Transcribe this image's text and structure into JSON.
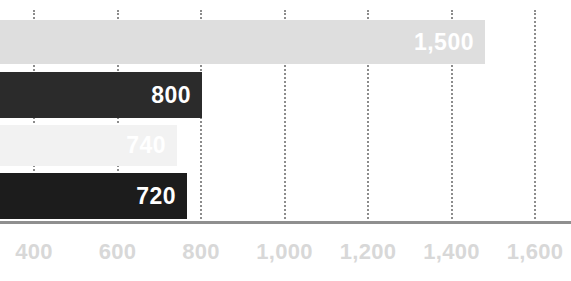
{
  "chart_data": {
    "type": "bar",
    "orientation": "horizontal",
    "title": "",
    "subtitle": "",
    "xlabel": "",
    "ylabel": "",
    "categories": [
      "",
      "",
      "",
      ""
    ],
    "values": [
      1500,
      800,
      740,
      720
    ],
    "data_labels": [
      "1,500",
      "800",
      "740",
      "720"
    ],
    "bar_colors": [
      "#dedede",
      "#2b2b2b",
      "#f2f2f2",
      "#1c1c1c"
    ],
    "label_colors": [
      "#ffffff",
      "#ffffff",
      "#ffffff",
      "#ffffff"
    ],
    "xlim": [
      330,
      1650
    ],
    "xticks": [
      400,
      600,
      800,
      1000,
      1200,
      1400,
      1600
    ],
    "xtick_labels": [
      "400",
      "600",
      "800",
      "1,000",
      "1,200",
      "1,400",
      "1,600"
    ],
    "grid": true,
    "grid_style": "dotted-vertical",
    "grid_color": "#8c8c8c",
    "axis_line_color": "#8f8f8f",
    "tick_label_color": "#d8d8d8",
    "legend": false,
    "legend_position": "none",
    "background": "#ffffff",
    "note": "bars are cropped at the left edge of the image; they begin off-canvas"
  },
  "axis": {
    "ticks": [
      {
        "value": 400,
        "label": "400"
      },
      {
        "value": 600,
        "label": "600"
      },
      {
        "value": 800,
        "label": "800"
      },
      {
        "value": 1000,
        "label": "1,000"
      },
      {
        "value": 1200,
        "label": "1,200"
      },
      {
        "value": 1400,
        "label": "1,400"
      },
      {
        "value": 1600,
        "label": "1,600"
      }
    ]
  },
  "bars": [
    {
      "label": "1,500",
      "value": 1500,
      "color": "#dedede",
      "label_color": "#ffffff",
      "top": 20,
      "height": 44,
      "end_x": 485
    },
    {
      "label": "800",
      "value": 800,
      "color": "#2b2b2b",
      "label_color": "#ffffff",
      "top": 72,
      "height": 46,
      "end_x": 202
    },
    {
      "label": "740",
      "value": 740,
      "color": "#f2f2f2",
      "label_color": "#ffffff",
      "top": 125,
      "height": 41,
      "end_x": 177
    },
    {
      "label": "720",
      "value": 720,
      "color": "#1c1c1c",
      "label_color": "#ffffff",
      "top": 173,
      "height": 46,
      "end_x": 187
    }
  ]
}
